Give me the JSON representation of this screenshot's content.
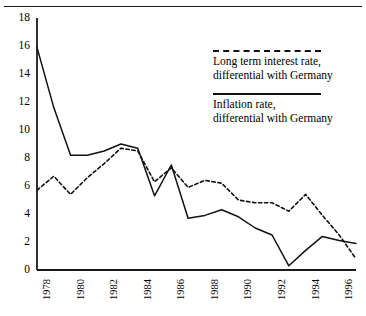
{
  "chart_data": {
    "type": "line",
    "title": "",
    "xlabel": "",
    "ylabel": "",
    "xlim": [
      1978,
      1997
    ],
    "ylim": [
      0,
      18
    ],
    "ytick_step": 2,
    "xtick_step": 2,
    "grid": false,
    "legend_position": "upper-right",
    "yticks": [
      "18",
      "16",
      "14",
      "12",
      "10",
      "8",
      "6",
      "4",
      "2",
      "0"
    ],
    "xticks": [
      "1978",
      "1980",
      "1982",
      "1984",
      "1986",
      "1988",
      "1990",
      "1992",
      "1994",
      "1996"
    ],
    "x": [
      1978,
      1979,
      1980,
      1981,
      1982,
      1983,
      1984,
      1985,
      1986,
      1987,
      1988,
      1989,
      1990,
      1991,
      1992,
      1993,
      1994,
      1995,
      1996,
      1997
    ],
    "series": [
      {
        "name": "Long term interest rate, differential with Germany",
        "style": "dashed",
        "color": "#111111",
        "values": [
          5.7,
          6.7,
          5.4,
          6.6,
          7.6,
          8.7,
          8.5,
          6.3,
          7.3,
          5.9,
          6.4,
          6.2,
          5.0,
          4.8,
          4.8,
          4.2,
          5.4,
          3.9,
          2.5,
          0.8
        ]
      },
      {
        "name": "Inflation rate, differential with Germany",
        "style": "solid",
        "color": "#111111",
        "values": [
          15.9,
          11.6,
          8.2,
          8.2,
          8.5,
          9.0,
          8.7,
          5.3,
          7.5,
          3.7,
          3.9,
          4.3,
          3.8,
          3.0,
          2.5,
          0.3,
          1.4,
          2.4,
          2.1,
          1.9
        ]
      }
    ]
  },
  "legend": {
    "entries": [
      {
        "style": "dashed",
        "line1": "Long term interest rate,",
        "line2": "differential with Germany"
      },
      {
        "style": "solid",
        "line1": "Inflation rate,",
        "line2": "differential with Germany"
      }
    ]
  }
}
